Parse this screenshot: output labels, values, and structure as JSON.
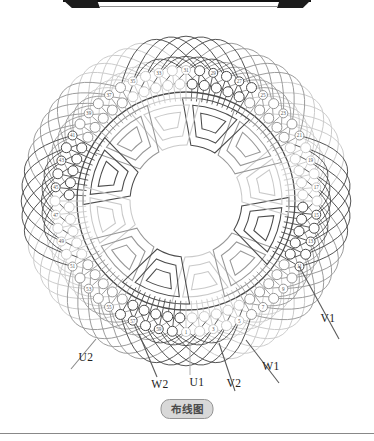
{
  "caption": {
    "text": "布线图"
  },
  "diagram": {
    "n_slots": 60,
    "slot_numbers": [
      1,
      3,
      5,
      7,
      9,
      11,
      13,
      15,
      17,
      19,
      21,
      23,
      25,
      27,
      29,
      31,
      33,
      35,
      37,
      39,
      41,
      43,
      45,
      47,
      49,
      51,
      53,
      55,
      57,
      59
    ],
    "geometry": {
      "cx": 186,
      "cy": 201,
      "r_outer_circles": 131,
      "r_inner_circles": 117,
      "r_bore": 109,
      "coil_pitch_slots": 6,
      "groups": 12,
      "arc_ctrl_outer": 205,
      "arc_ctrl_inner": 178,
      "blade_r_out": [
        103,
        96,
        89
      ],
      "blade_r_in": [
        56,
        65,
        74
      ],
      "blade_w_out": [
        20,
        14,
        8.5
      ],
      "blade_w_in": [
        13,
        9,
        5.5
      ]
    },
    "colors": {
      "phase_dark": "#4b4b4b",
      "phase_light": "#c9c9c9",
      "phase_mid": "#979797",
      "bore_circle": "#4a4a4a",
      "number_text": "#555555"
    },
    "terminals": [
      {
        "label": "U2",
        "x": 86,
        "y": 357,
        "line": [
          96,
          339,
          71,
          369
        ],
        "color": "#8a8a8a"
      },
      {
        "label": "W2",
        "x": 160,
        "y": 384,
        "line": [
          139,
          334,
          157,
          377
        ],
        "color": "#5a5a5a"
      },
      {
        "label": "U1",
        "x": 197,
        "y": 382,
        "line": [
          190,
          344,
          190,
          375
        ],
        "color": "#b5b5b5"
      },
      {
        "label": "V2",
        "x": 234,
        "y": 383,
        "line": [
          219,
          343,
          235,
          391
        ],
        "color": "#5a5a5a"
      },
      {
        "label": "W1",
        "x": 271,
        "y": 366,
        "line": [
          246,
          340,
          279,
          383
        ],
        "color": "#5a5a5a"
      },
      {
        "label": "V1",
        "x": 328,
        "y": 318,
        "line": [
          299,
          266,
          339,
          339
        ],
        "color": "#5a5a5a"
      }
    ]
  }
}
